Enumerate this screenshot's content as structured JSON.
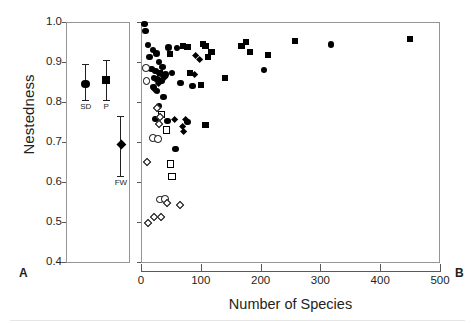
{
  "figure": {
    "axes": {
      "ylabel": "Nestedness",
      "xlabel": "Number of Species",
      "yticks": [
        "1.0",
        "0.9",
        "0.8",
        "0.7",
        "0.6",
        "0.5",
        "0.4"
      ],
      "ytick_values": [
        1.0,
        0.9,
        0.8,
        0.7,
        0.6,
        0.5,
        0.4
      ],
      "xticks": [
        "0",
        "100",
        "200",
        "300",
        "400",
        "500"
      ],
      "xtick_values": [
        0,
        100,
        200,
        300,
        400,
        500
      ],
      "ylim": [
        0.4,
        1.0
      ],
      "xlim": [
        0,
        500
      ],
      "grid": false
    },
    "panels": [
      {
        "letter": "A",
        "name": "mean-nestedness-by-network-type"
      },
      {
        "letter": "B",
        "name": "nestedness-vs-species-richness"
      }
    ]
  },
  "chart_data": [
    {
      "type": "scatter",
      "panel": "A",
      "title": "",
      "xlabel": "",
      "ylabel": "Nestedness",
      "ylim": [
        0.4,
        1.0
      ],
      "grid": false,
      "legend": "none",
      "groups": [
        {
          "name": "SD",
          "label": "SD",
          "marker": "circle-filled",
          "x_pos": 0.3,
          "mean": 0.845,
          "err_low": 0.805,
          "err_high": 0.895
        },
        {
          "name": "P",
          "label": "P",
          "marker": "square-filled",
          "x_pos": 0.62,
          "mean": 0.855,
          "err_low": 0.805,
          "err_high": 0.905
        },
        {
          "name": "FW",
          "label": "FW",
          "marker": "diamond-filled",
          "x_pos": 0.85,
          "mean": 0.695,
          "err_low": 0.615,
          "err_high": 0.765
        }
      ]
    },
    {
      "type": "scatter",
      "panel": "B",
      "title": "",
      "xlabel": "Number of Species",
      "ylabel": "Nestedness",
      "xlim": [
        0,
        500
      ],
      "ylim": [
        0.4,
        1.0
      ],
      "grid": false,
      "legend": "none",
      "series": [
        {
          "name": "filled-circles",
          "marker": "circle-filled",
          "points": [
            [
              6,
              0.995
            ],
            [
              8,
              0.977
            ],
            [
              12,
              0.942
            ],
            [
              20,
              0.93
            ],
            [
              14,
              0.912
            ],
            [
              26,
              0.921
            ],
            [
              46,
              0.936
            ],
            [
              60,
              0.935
            ],
            [
              30,
              0.9
            ],
            [
              36,
              0.888
            ],
            [
              18,
              0.882
            ],
            [
              24,
              0.878
            ],
            [
              31,
              0.872
            ],
            [
              41,
              0.869
            ],
            [
              52,
              0.872
            ],
            [
              22,
              0.86
            ],
            [
              28,
              0.856
            ],
            [
              34,
              0.852
            ],
            [
              66,
              0.848
            ],
            [
              86,
              0.84
            ],
            [
              21,
              0.838
            ],
            [
              27,
              0.828
            ],
            [
              38,
              0.812
            ],
            [
              206,
              0.88
            ],
            [
              318,
              0.944
            ],
            [
              30,
              0.79
            ],
            [
              24,
              0.757
            ],
            [
              44,
              0.753
            ],
            [
              78,
              0.75
            ],
            [
              58,
              0.682
            ]
          ]
        },
        {
          "name": "filled-squares",
          "marker": "square-filled",
          "points": [
            [
              48,
              0.92
            ],
            [
              70,
              0.94
            ],
            [
              78,
              0.938
            ],
            [
              104,
              0.945
            ],
            [
              108,
              0.94
            ],
            [
              118,
              0.925
            ],
            [
              112,
              0.912
            ],
            [
              168,
              0.94
            ],
            [
              176,
              0.95
            ],
            [
              182,
              0.925
            ],
            [
              212,
              0.918
            ],
            [
              258,
              0.953
            ],
            [
              450,
              0.958
            ],
            [
              32,
              0.872
            ],
            [
              40,
              0.868
            ],
            [
              82,
              0.872
            ],
            [
              140,
              0.86
            ],
            [
              100,
              0.843
            ],
            [
              108,
              0.742
            ]
          ]
        },
        {
          "name": "filled-diamonds",
          "marker": "diamond-filled",
          "points": [
            [
              92,
              0.915
            ],
            [
              98,
              0.905
            ],
            [
              34,
              0.868
            ],
            [
              40,
              0.862
            ],
            [
              90,
              0.868
            ],
            [
              30,
              0.845
            ],
            [
              22,
              0.83
            ],
            [
              56,
              0.756
            ],
            [
              74,
              0.755
            ],
            [
              70,
              0.738
            ],
            [
              72,
              0.727
            ]
          ]
        },
        {
          "name": "open-circles",
          "marker": "circle-open",
          "points": [
            [
              8,
              0.885
            ],
            [
              9,
              0.852
            ],
            [
              20,
              0.71
            ],
            [
              28,
              0.707
            ],
            [
              32,
              0.556
            ],
            [
              40,
              0.558
            ]
          ]
        },
        {
          "name": "open-squares",
          "marker": "square-open",
          "points": [
            [
              34,
              0.768
            ],
            [
              42,
              0.73
            ],
            [
              50,
              0.645
            ],
            [
              52,
              0.613
            ]
          ]
        },
        {
          "name": "open-diamonds",
          "marker": "diamond-open",
          "points": [
            [
              26,
              0.785
            ],
            [
              32,
              0.762
            ],
            [
              30,
              0.745
            ],
            [
              10,
              0.65
            ],
            [
              44,
              0.548
            ],
            [
              66,
              0.543
            ],
            [
              22,
              0.512
            ],
            [
              34,
              0.513
            ],
            [
              12,
              0.498
            ]
          ]
        }
      ]
    }
  ]
}
